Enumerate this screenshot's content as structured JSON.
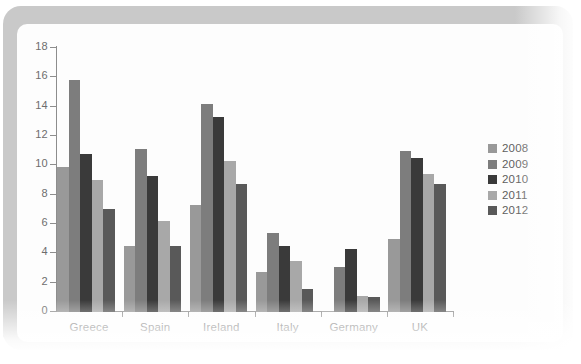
{
  "chart_data": {
    "type": "bar",
    "title": "",
    "subtitle": "",
    "xlabel": "",
    "ylabel": "",
    "categories": [
      "Greece",
      "Spain",
      "Ireland",
      "Italy",
      "Germany",
      "UK"
    ],
    "series": [
      {
        "name": "2008",
        "color": "#999999",
        "values": [
          9.9,
          4.5,
          7.3,
          2.7,
          0.1,
          5.0
        ]
      },
      {
        "name": "2009",
        "color": "#7d7d7d",
        "values": [
          15.8,
          11.1,
          14.2,
          5.4,
          3.1,
          11.0
        ]
      },
      {
        "name": "2010",
        "color": "#3a3a3a",
        "values": [
          10.8,
          9.3,
          13.3,
          4.5,
          4.3,
          10.5
        ]
      },
      {
        "name": "2011",
        "color": "#a8a8a8",
        "values": [
          9.0,
          6.2,
          10.3,
          3.5,
          1.1,
          9.4
        ]
      },
      {
        "name": "2012",
        "color": "#595959",
        "values": [
          7.0,
          4.5,
          8.7,
          1.6,
          1.0,
          8.7
        ]
      }
    ],
    "ylim": [
      0,
      18
    ],
    "ytick_labels": [
      "0",
      "2",
      "4",
      "6",
      "8",
      "10",
      "12",
      "14",
      "16",
      "18"
    ],
    "ytick_values": [
      0,
      2,
      4,
      6,
      8,
      10,
      12,
      14,
      16,
      18
    ],
    "grid": false,
    "legend_position": "right",
    "legend_entries": [
      "2008",
      "2009",
      "2010",
      "2011",
      "2012"
    ],
    "axis_color": "#8d8d8d",
    "text_color": "#5f5f5f",
    "frame_color": "#c9c9c9",
    "background_color": "#fdfdfd"
  }
}
